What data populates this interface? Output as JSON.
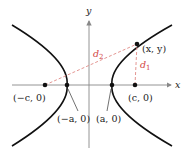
{
  "diagram": {
    "type": "hyperbola-foci",
    "axes": {
      "x_label": "x",
      "y_label": "y"
    },
    "colors": {
      "curve": "#111111",
      "axis": "#888888",
      "distance": "#d2433f",
      "point": "#111111"
    },
    "points": [
      {
        "id": "neg_c",
        "label": "(−c, 0)"
      },
      {
        "id": "neg_a",
        "label": "(−a, 0)"
      },
      {
        "id": "pos_a",
        "label": "(a, 0)"
      },
      {
        "id": "pos_c",
        "label": "(c, 0)"
      },
      {
        "id": "xy",
        "label": "(x, y)"
      }
    ],
    "distances": [
      {
        "id": "d1",
        "label_main": "d",
        "label_sub": "1"
      },
      {
        "id": "d2",
        "label_main": "d",
        "label_sub": "2"
      }
    ]
  }
}
